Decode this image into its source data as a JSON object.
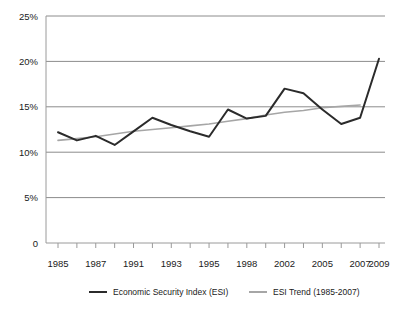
{
  "chart_data": {
    "type": "line",
    "title": "",
    "xlabel": "",
    "ylabel": "",
    "ylim": [
      0,
      25
    ],
    "ytick_labels": [
      "0",
      "5%",
      "10%",
      "15%",
      "20%",
      "25%"
    ],
    "ytick_values": [
      0,
      5,
      10,
      15,
      20,
      25
    ],
    "grid": "horizontal",
    "legend_position": "bottom",
    "x": [
      1985,
      1986,
      1987,
      1989,
      1991,
      1992,
      1993,
      1994,
      1995,
      1996,
      1998,
      2000,
      2002,
      2003,
      2005,
      2006,
      2007,
      2009
    ],
    "xtick_labels": [
      "1985",
      "1987",
      "1991",
      "1993",
      "1995",
      "1998",
      "2002",
      "2005",
      "2007",
      "2009"
    ],
    "xtick_label_indices": [
      0,
      2,
      4,
      6,
      8,
      10,
      12,
      14,
      16,
      17
    ],
    "series": [
      {
        "name": "Economic Security Index (ESI)",
        "color": "#2b2b2b",
        "width": 2.0,
        "values": [
          12.2,
          11.3,
          11.8,
          10.8,
          12.3,
          13.8,
          13.0,
          12.3,
          11.7,
          14.7,
          13.7,
          14.0,
          17.0,
          16.5,
          14.7,
          13.1,
          13.8,
          20.3
        ]
      },
      {
        "name": "ESI Trend (1985-2007)",
        "color": "#a6a6a6",
        "width": 1.6,
        "values": [
          11.3,
          11.5,
          11.7,
          12.0,
          12.3,
          12.5,
          12.7,
          12.9,
          13.1,
          13.4,
          13.7,
          14.1,
          14.4,
          14.6,
          14.9,
          15.05,
          15.2,
          null
        ]
      }
    ]
  },
  "legend": {
    "items": [
      {
        "label": "Economic Security Index (ESI)",
        "color": "#2b2b2b",
        "width": 2.0
      },
      {
        "label": "ESI Trend (1985-2007)",
        "color": "#a6a6a6",
        "width": 2.0
      }
    ]
  },
  "colors": {
    "axis": "#9a9a9a",
    "gridline": "#8c8c8c",
    "text": "#1a1a1a",
    "background": "#ffffff"
  }
}
